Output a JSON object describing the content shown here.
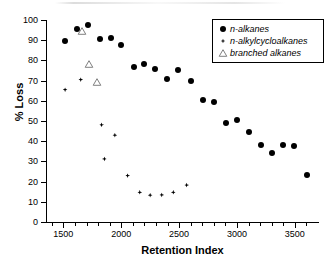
{
  "chart_data": {
    "type": "scatter",
    "title": "",
    "xlabel": "Retention Index",
    "ylabel": "% Loss",
    "xlim": [
      1350,
      3700
    ],
    "ylim": [
      0,
      100
    ],
    "xticks": [
      1500,
      2000,
      2500,
      3000,
      3500
    ],
    "xtick_labels": [
      "1500",
      "2000",
      "2500",
      "3000",
      "3500"
    ],
    "xtick_minor_step": 100,
    "yticks": [
      0,
      10,
      20,
      30,
      40,
      50,
      60,
      70,
      80,
      90,
      100
    ],
    "ytick_labels": [
      "0",
      "10",
      "20",
      "30",
      "40",
      "50",
      "60",
      "70",
      "80",
      "90",
      "100"
    ],
    "grid": false,
    "legend_position": "top-right",
    "series": [
      {
        "name": "n-alkanes",
        "marker": "filled-circle",
        "color": "#000000",
        "points": [
          {
            "x": 1510,
            "y": 89.5
          },
          {
            "x": 1615,
            "y": 95.5
          },
          {
            "x": 1715,
            "y": 97.5
          },
          {
            "x": 1820,
            "y": 90.5
          },
          {
            "x": 1910,
            "y": 91.3
          },
          {
            "x": 1995,
            "y": 87.5
          },
          {
            "x": 2110,
            "y": 76.7
          },
          {
            "x": 2200,
            "y": 78.2
          },
          {
            "x": 2295,
            "y": 75.8
          },
          {
            "x": 2395,
            "y": 71.0
          },
          {
            "x": 2490,
            "y": 75.4
          },
          {
            "x": 2600,
            "y": 69.7
          },
          {
            "x": 2710,
            "y": 60.6
          },
          {
            "x": 2805,
            "y": 59.3
          },
          {
            "x": 2905,
            "y": 49.0
          },
          {
            "x": 3000,
            "y": 50.7
          },
          {
            "x": 3105,
            "y": 44.6
          },
          {
            "x": 3205,
            "y": 38.0
          },
          {
            "x": 3300,
            "y": 34.2
          },
          {
            "x": 3395,
            "y": 38.2
          },
          {
            "x": 3495,
            "y": 37.4
          },
          {
            "x": 3605,
            "y": 23.4
          }
        ]
      },
      {
        "name": "n-alkylcycloalkanes",
        "marker": "filled-diamond",
        "color": "#000000",
        "points": [
          {
            "x": 1515,
            "y": 65.5
          },
          {
            "x": 1650,
            "y": 70.5
          },
          {
            "x": 1830,
            "y": 48.1
          },
          {
            "x": 1945,
            "y": 43.0
          },
          {
            "x": 1855,
            "y": 31.2
          },
          {
            "x": 2055,
            "y": 23.0
          },
          {
            "x": 2160,
            "y": 14.7
          },
          {
            "x": 2250,
            "y": 13.3
          },
          {
            "x": 2350,
            "y": 13.4
          },
          {
            "x": 2450,
            "y": 14.7
          },
          {
            "x": 2565,
            "y": 18.3
          }
        ]
      },
      {
        "name": "branched alkanes",
        "marker": "open-triangle",
        "color": "#808080",
        "points": [
          {
            "x": 1662,
            "y": 94.8
          },
          {
            "x": 1723,
            "y": 78.2
          },
          {
            "x": 1790,
            "y": 69.3
          }
        ]
      }
    ]
  },
  "legend": {
    "entries": [
      {
        "label": "n-alkanes",
        "marker": "filled-circle"
      },
      {
        "label": "n-alkylcycloalkanes",
        "marker": "filled-diamond"
      },
      {
        "label": "branched alkanes",
        "marker": "open-triangle"
      }
    ]
  }
}
